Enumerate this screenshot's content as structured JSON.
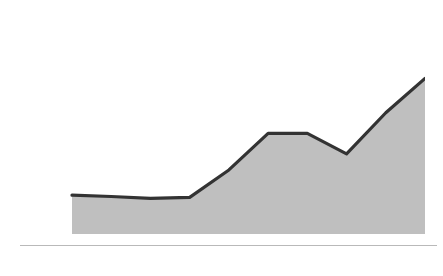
{
  "chart_data": {
    "type": "area",
    "ylabel": "Number\nof People",
    "xlabel": "",
    "categories": [
      2000,
      2002,
      2004,
      2006,
      2008,
      2010,
      2012,
      2014,
      2016,
      2018
    ],
    "x": [
      2000,
      2002,
      2004,
      2006,
      2008,
      2010,
      2012,
      2014,
      2016,
      2018
    ],
    "values": [
      8500,
      8200,
      7800,
      8000,
      14000,
      22000,
      22000,
      17500,
      26500,
      34000
    ],
    "series": [
      {
        "name": "Total Murders",
        "values": [
          8500,
          8200,
          7800,
          8000,
          14000,
          22000,
          22000,
          17500,
          26500,
          34000
        ]
      }
    ],
    "xtick_labels": [
      "2000",
      "2002",
      "2004",
      "2006",
      "2008",
      "2010",
      "2012",
      "2014",
      "2016",
      "2018"
    ],
    "ytick_labels": [
      "0",
      "10,000",
      "20,000",
      "30,000",
      "40,000"
    ],
    "ytick_values": [
      0,
      10000,
      20000,
      30000,
      40000
    ],
    "ylim": [
      0,
      40000
    ],
    "xlim": [
      2000,
      2018
    ],
    "grid": "horizontal-bands",
    "legend": "none",
    "colors": {
      "line": "#333333",
      "area_fill": "#b4b4b4",
      "band_light": "#f2f2f2",
      "band_dark": "#e2e2e2",
      "axis_line": "#b9b9b9",
      "text": "#1b1b1b"
    }
  }
}
